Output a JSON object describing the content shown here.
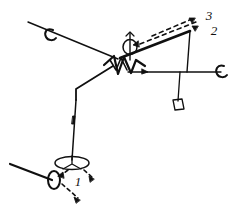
{
  "figure": {
    "background_color": "#ffffff",
    "stroke_color": "#101010",
    "width": 235,
    "height": 205,
    "callouts": [
      {
        "id": "callout-1",
        "label": "1",
        "x": 78,
        "y": 180,
        "font_size": 13
      },
      {
        "id": "callout-2",
        "label": "2",
        "x": 211,
        "y": 30,
        "font_size": 13
      },
      {
        "id": "callout-3",
        "label": "3",
        "x": 206,
        "y": 16,
        "font_size": 13
      }
    ],
    "markers": {
      "upper_left_ellipse": "ellipse-marker",
      "center_ellipse": "ellipse-marker",
      "right_ellipse": "ellipse-marker",
      "bottom_ellipse": "ellipse-marker",
      "bottom_left_ellipse": "ellipse-marker",
      "hanging_plate": "parallelogram-marker",
      "center_zigzag": "zigzag-marker"
    },
    "arrows": {
      "style": "dashed",
      "count": 6
    }
  }
}
